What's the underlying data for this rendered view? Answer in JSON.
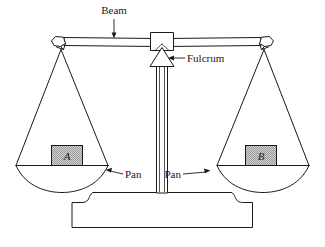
{
  "figure": {
    "background_color": "#ffffff",
    "line_color": "#1a1a1a",
    "block_fill_color": "#c9c9c9"
  },
  "labels": {
    "beam": "Beam",
    "fulcrum": "Fulcrum",
    "pan_left": "Pan",
    "pan_right": "Pan"
  },
  "blocks": {
    "left": {
      "letter": "A",
      "name": "block-a"
    },
    "right": {
      "letter": "B",
      "name": "block-b"
    }
  },
  "parts": [
    "beam",
    "fulcrum",
    "pan-left",
    "pan-right",
    "column",
    "base",
    "beam-end-left",
    "beam-end-right"
  ]
}
